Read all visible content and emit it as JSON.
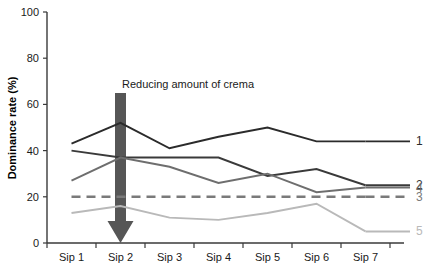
{
  "chart_data": {
    "type": "line",
    "title": "",
    "xlabel": "",
    "ylabel": "Dominance rate (%)",
    "categories": [
      "Sip 1",
      "Sip 2",
      "Sip 3",
      "Sip 4",
      "Sip 5",
      "Sip 6",
      "Sip 7"
    ],
    "ylim": [
      0,
      100
    ],
    "yticks": [
      0,
      20,
      40,
      60,
      80,
      100
    ],
    "grid": false,
    "legend_position": "right",
    "series": [
      {
        "name": "1",
        "label": "1",
        "color": "#2b2b2b",
        "style": "solid",
        "values": [
          43,
          52,
          41,
          46,
          50,
          44,
          44
        ]
      },
      {
        "name": "2",
        "label": "2",
        "color": "#3a3a3a",
        "style": "solid",
        "values": [
          40,
          37,
          37,
          37,
          29,
          32,
          25
        ]
      },
      {
        "name": "4",
        "label": "4",
        "color": "#6e6e6e",
        "style": "solid",
        "values": [
          27,
          37,
          33,
          26,
          30,
          22,
          24
        ]
      },
      {
        "name": "3",
        "label": "3",
        "color": "#7a7a7a",
        "style": "dashed",
        "values": [
          20,
          20,
          20,
          20,
          20,
          20,
          20
        ]
      },
      {
        "name": "5",
        "label": "5",
        "color": "#b9b9b9",
        "style": "solid",
        "values": [
          13,
          16,
          11,
          10,
          13,
          17,
          5
        ]
      }
    ],
    "annotations": [
      {
        "text": "Reducing amount of crema",
        "kind": "down-arrow",
        "at_category": "Sip 2",
        "color": "#565656"
      }
    ]
  }
}
